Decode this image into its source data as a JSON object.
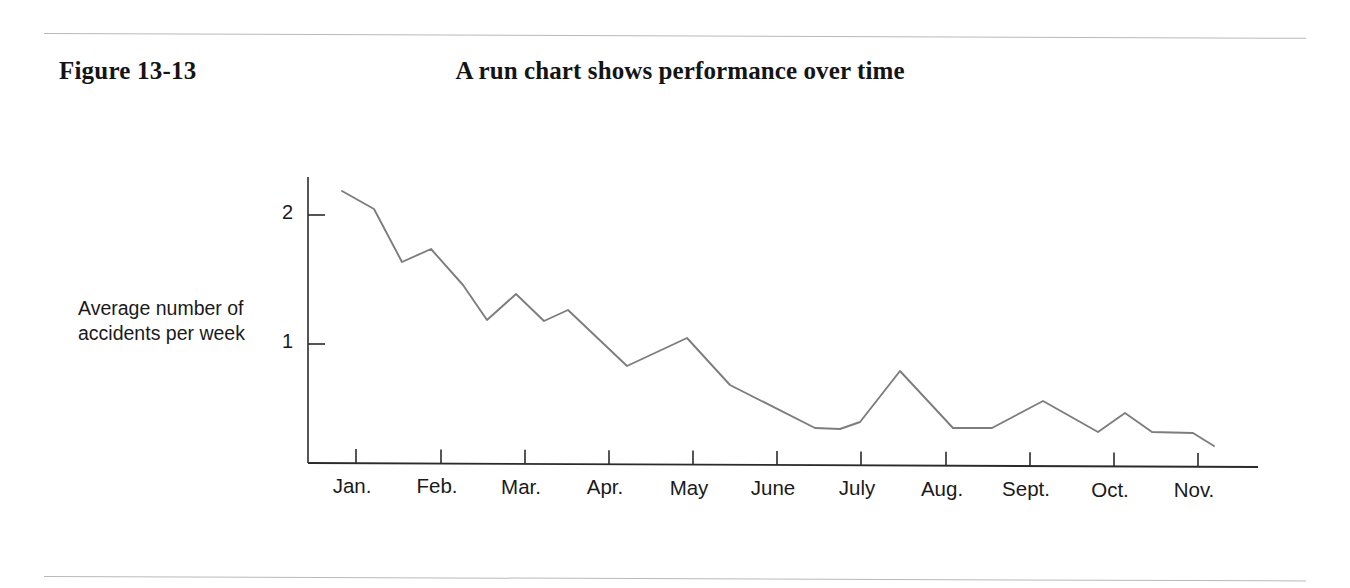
{
  "figure": {
    "label": "Figure 13-13",
    "title": "A run chart shows performance over time"
  },
  "rules": {
    "top_present": "true",
    "bottom_present": "true",
    "color": "#b9b9bb"
  },
  "chart_data": {
    "type": "line",
    "title": "A run chart shows performance over time",
    "xlabel": "",
    "ylabel": "Average number of accidents per week",
    "ylabel_lines": [
      "Average number of",
      "accidents per week"
    ],
    "ytick_labels": [
      "1",
      "2"
    ],
    "ytick_values": [
      1,
      2
    ],
    "ylim": [
      0,
      2.35
    ],
    "xtick_labels": [
      "Jan.",
      "Feb.",
      "Mar.",
      "Apr.",
      "May",
      "June",
      "July",
      "Aug.",
      "Sept.",
      "Oct.",
      "Nov."
    ],
    "categories": [
      "Jan.",
      "Feb.",
      "Mar.",
      "Apr.",
      "May",
      "June",
      "July",
      "Aug.",
      "Sept.",
      "Oct.",
      "Nov."
    ],
    "grid": "off",
    "legend": "none",
    "line_color": "#7d7d80",
    "axis_color": "#2b2b2b",
    "series": [
      {
        "name": "Average number of accidents per week",
        "x": [
          0.0,
          0.35,
          0.67,
          1.0,
          1.35,
          1.62,
          1.94,
          2.25,
          2.52,
          3.17,
          3.83,
          4.3,
          5.24,
          6.18,
          7.76,
          8.67,
          9.65
        ],
        "values": [
          2.19,
          2.05,
          1.64,
          1.74,
          1.46,
          1.19,
          1.39,
          1.18,
          1.26,
          0.83,
          1.05,
          0.68,
          0.35,
          0.79,
          0.56,
          0.47,
          0.21
        ]
      }
    ],
    "points_px": [
      [
        342,
        191
      ],
      [
        374,
        209
      ],
      [
        402,
        262
      ],
      [
        431,
        249
      ],
      [
        463,
        285
      ],
      [
        487,
        320
      ],
      [
        516,
        294
      ],
      [
        544,
        321
      ],
      [
        568,
        310
      ],
      [
        627,
        366
      ],
      [
        687,
        338
      ],
      [
        730,
        385
      ],
      [
        815,
        428
      ],
      [
        840,
        429
      ],
      [
        860,
        422
      ],
      [
        900,
        371
      ],
      [
        953,
        428
      ],
      [
        992,
        428
      ],
      [
        1043,
        401
      ],
      [
        1098,
        432
      ],
      [
        1125,
        413
      ],
      [
        1152,
        432
      ],
      [
        1193,
        433
      ],
      [
        1214,
        446
      ]
    ],
    "axis_px": {
      "x_origin": 308,
      "y_top": 177,
      "y_baseline": 463,
      "x_end": 1258,
      "y_value_2": 215,
      "y_value_1": 344,
      "x_ticks": [
        356,
        441,
        525,
        609,
        693,
        777,
        861,
        946,
        1030,
        1114,
        1198
      ]
    }
  }
}
